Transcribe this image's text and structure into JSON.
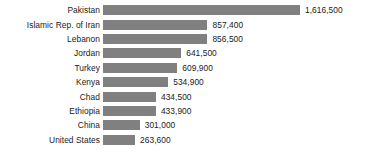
{
  "chart_data": {
    "type": "bar",
    "orientation": "horizontal",
    "title": "",
    "xlabel": "",
    "ylabel": "",
    "grid": false,
    "legend": null,
    "xlim": [
      0,
      1616500
    ],
    "categories": [
      "Pakistan",
      "Islamic Rep. of Iran",
      "Lebanon",
      "Jordan",
      "Turkey",
      "Kenya",
      "Chad",
      "Ethiopia",
      "China",
      "United States"
    ],
    "values": [
      1616500,
      857400,
      856500,
      641500,
      609900,
      534900,
      434500,
      433900,
      301000,
      263600
    ],
    "value_labels": [
      "1,616,500",
      "857,400",
      "856,500",
      "641,500",
      "609,900",
      "534,900",
      "434,500",
      "433,900",
      "301,000",
      "263,600"
    ],
    "bar_color": "#808080",
    "background_color": "#ffffff",
    "text_color": "#1a1a1a"
  }
}
